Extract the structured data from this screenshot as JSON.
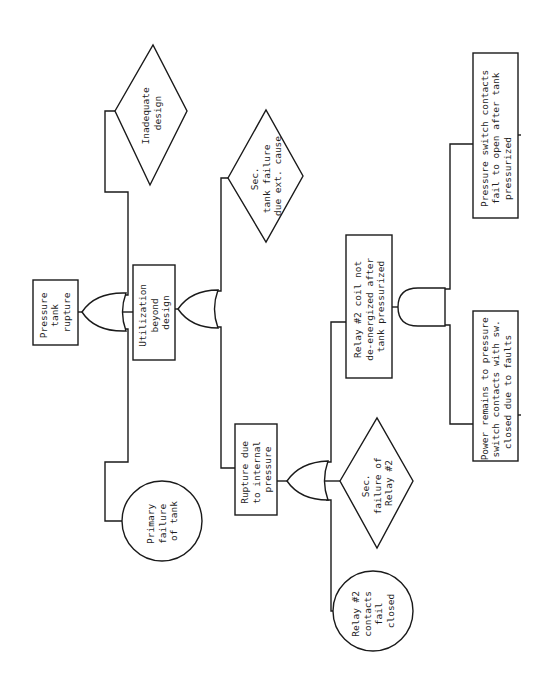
{
  "diagram": {
    "type": "fault-tree",
    "orientation": "rotated-90-ccw",
    "colors": {
      "line": "#1a1a1a",
      "background": "#ffffff",
      "text": "#1e1e1e"
    },
    "top_event": {
      "id": "E1",
      "shape": "rectangle",
      "lines": [
        "Pressure",
        "tank",
        "rupture"
      ]
    },
    "gates": [
      {
        "id": "G1",
        "type": "OR",
        "output": "E1",
        "inputs": [
          "E2",
          "B1",
          "E3"
        ]
      },
      {
        "id": "G2",
        "type": "OR",
        "output": "E2",
        "inputs": [
          "U1",
          "E4"
        ]
      },
      {
        "id": "G3",
        "type": "OR",
        "output": "E4",
        "inputs": [
          "E5",
          "U2",
          "B2"
        ]
      },
      {
        "id": "G4",
        "type": "AND",
        "output": "E5",
        "inputs": [
          "E6",
          "E7"
        ]
      }
    ],
    "events": {
      "E2": {
        "shape": "rectangle",
        "lines": [
          "Utilization",
          "beyond",
          "design"
        ]
      },
      "B1": {
        "shape": "diamond",
        "lines": [
          "Inadequate",
          "design"
        ]
      },
      "E3": {
        "shape": "circle",
        "lines": [
          "Primary",
          "failure",
          "of tank"
        ]
      },
      "U1": {
        "shape": "diamond",
        "lines": [
          "Sec.",
          "tank failure",
          "due ext. cause"
        ]
      },
      "E4": {
        "shape": "rectangle",
        "lines": [
          "Rupture due",
          "to internal",
          "pressure"
        ]
      },
      "E5": {
        "shape": "rectangle",
        "lines": [
          "Relay #2 coil not",
          "de-energized after",
          "tank pressurized"
        ]
      },
      "U2": {
        "shape": "diamond",
        "lines": [
          "Sec.",
          "failure of",
          "Relay #2"
        ]
      },
      "B2": {
        "shape": "circle",
        "lines": [
          "Relay #2",
          "contacts",
          "fail",
          "closed"
        ]
      },
      "E6": {
        "shape": "rectangle",
        "lines": [
          "Pressure switch contacts",
          "fail to open after tank",
          "pressurized"
        ]
      },
      "E7": {
        "shape": "rectangle",
        "lines": [
          "Power remains to pressure",
          "switch contacts with sw.",
          "closed due to faults"
        ]
      }
    }
  }
}
